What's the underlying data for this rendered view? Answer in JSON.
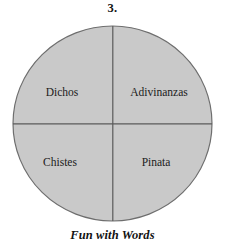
{
  "figure": {
    "number_label": "3.",
    "caption": "Fun with Words",
    "background_color": "#ffffff",
    "text_color": "#1a1a1a"
  },
  "diagram": {
    "type": "quadrant-circle",
    "fill_color": "#c9c9c9",
    "stroke_color": "#6e6e6e",
    "divider_color": "#5a5a5a",
    "quadrants": [
      {
        "position": "top-left",
        "label": "Dichos"
      },
      {
        "position": "top-right",
        "label": "Adivinanzas"
      },
      {
        "position": "bottom-left",
        "label": "Chistes"
      },
      {
        "position": "bottom-right",
        "label": "Pinata"
      }
    ]
  }
}
